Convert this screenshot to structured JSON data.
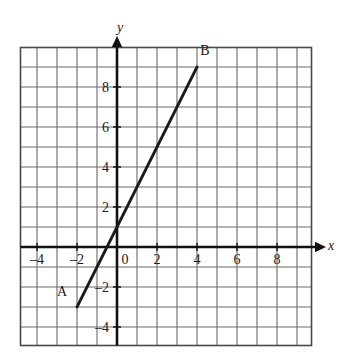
{
  "chart_data": {
    "type": "line",
    "title": "",
    "xlabel": "x",
    "ylabel": "y",
    "grid": true,
    "legend_position": "none",
    "xlim": [
      -5,
      9.7
    ],
    "ylim": [
      -5,
      10
    ],
    "x_ticks": [
      -4,
      -2,
      0,
      2,
      4,
      6,
      8
    ],
    "x_tick_labels": [
      "–4",
      "–2",
      "0",
      "2",
      "4",
      "6",
      "8"
    ],
    "y_ticks": [
      -4,
      -2,
      2,
      4,
      6,
      8
    ],
    "y_tick_labels": [
      "–4",
      "–2",
      "2",
      "4",
      "6",
      "8"
    ],
    "grid_step": 1,
    "series": [
      {
        "name": "AB",
        "type": "segment",
        "points": [
          {
            "label": "A",
            "x": -2,
            "y": -3
          },
          {
            "label": "B",
            "x": 4,
            "y": 9
          }
        ],
        "slope": 2,
        "y_intercept": 1,
        "color": "#1a1a1a"
      }
    ],
    "annotations": [
      {
        "name": "point-label-a",
        "text": "A",
        "x": -2.75,
        "y": -2.45
      },
      {
        "name": "point-label-b",
        "text": "B",
        "x": 4.4,
        "y": 9.6
      }
    ]
  },
  "axes": {
    "x_axis_label": "x",
    "y_axis_label": "y"
  },
  "colors": {
    "grid_line": "#6b6b6b",
    "grid_border": "#4a4a4a",
    "axis": "#111111",
    "segment": "#111111",
    "text": "#1a1a1a",
    "background": "#ffffff"
  }
}
